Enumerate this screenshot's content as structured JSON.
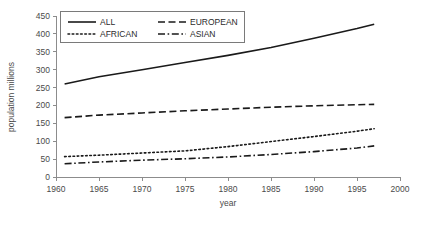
{
  "chart_data": {
    "type": "line",
    "title": "",
    "xlabel": "year",
    "ylabel": "population  millions",
    "xlim": [
      1960,
      2000
    ],
    "ylim": [
      0,
      450
    ],
    "xticks": [
      1960,
      1965,
      1970,
      1975,
      1980,
      1985,
      1990,
      1995,
      2000
    ],
    "yticks": [
      0,
      50,
      100,
      150,
      200,
      250,
      300,
      350,
      400,
      450
    ],
    "grid": false,
    "legend_position": "upper-left-inside",
    "x": [
      1961,
      1965,
      1970,
      1975,
      1980,
      1985,
      1990,
      1995,
      1997
    ],
    "series": [
      {
        "name": "ALL",
        "style": "solid",
        "color": "#1a1a1a",
        "values": [
          260,
          280,
          300,
          320,
          340,
          362,
          388,
          415,
          427
        ]
      },
      {
        "name": "EUROPEAN",
        "style": "dashed",
        "color": "#1a1a1a",
        "values": [
          166,
          173,
          179,
          185,
          190,
          195,
          199,
          202,
          203
        ]
      },
      {
        "name": "AFRICAN",
        "style": "dotted",
        "color": "#1a1a1a",
        "values": [
          57,
          61,
          67,
          73,
          85,
          99,
          113,
          128,
          135
        ]
      },
      {
        "name": "ASIAN",
        "style": "dashdot",
        "color": "#1a1a1a",
        "values": [
          37,
          42,
          47,
          51,
          56,
          63,
          71,
          81,
          87
        ]
      }
    ]
  },
  "axes": {
    "x_title": "year",
    "y_title": "population  millions",
    "x_tick_labels": [
      "1960",
      "1965",
      "1970",
      "1975",
      "1980",
      "1985",
      "1990",
      "1995",
      "2000"
    ],
    "y_tick_labels": [
      "0",
      "50",
      "100",
      "150",
      "200",
      "250",
      "300",
      "350",
      "400",
      "450"
    ]
  },
  "legend": {
    "entries": [
      {
        "label": "ALL",
        "style": "solid"
      },
      {
        "label": "EUROPEAN",
        "style": "dashed"
      },
      {
        "label": "AFRICAN",
        "style": "dotted"
      },
      {
        "label": "ASIAN",
        "style": "dashdot"
      }
    ]
  },
  "colors": {
    "line": "#1a1a1a",
    "axis": "#8c8c8c",
    "text": "#4a4a4a",
    "background": "#ffffff"
  }
}
